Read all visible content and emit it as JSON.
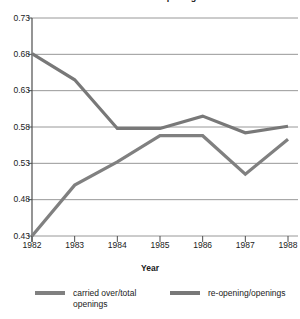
{
  "chart_data": {
    "type": "line",
    "title": "Trends in Job Openings",
    "xlabel": "Year",
    "ylabel": "",
    "x": [
      1982,
      1983,
      1984,
      1985,
      1986,
      1987,
      1988
    ],
    "categories": [
      "1982",
      "1983",
      "1984",
      "1985",
      "1986",
      "1987",
      "1988"
    ],
    "series": [
      {
        "name": "carried over/total openings",
        "color": "#808080",
        "values": [
          0.43,
          0.5,
          0.532,
          0.568,
          0.568,
          0.515,
          0.563
        ]
      },
      {
        "name": "re-opening/openings",
        "color": "#787878",
        "values": [
          0.681,
          0.645,
          0.578,
          0.578,
          0.595,
          0.572,
          0.581
        ]
      }
    ],
    "ylim": [
      0.43,
      0.73
    ],
    "xlim": [
      1982,
      1988
    ],
    "yticks": [
      "0.73",
      "0.68",
      "0.63",
      "0.58",
      "0.53",
      "0.48",
      "0.43"
    ],
    "ytick_values": [
      0.73,
      0.68,
      0.63,
      0.58,
      0.53,
      0.48,
      0.43
    ],
    "grid": true,
    "legend_position": "bottom"
  },
  "axes": {
    "x_label": "Year"
  },
  "legend": {
    "entries": [
      {
        "label": "carried over/total openings"
      },
      {
        "label": "re-opening/openings"
      }
    ]
  },
  "colors": {
    "line_a": "#808080",
    "line_b": "#787878",
    "grid": "#8c8c8c",
    "axis": "#4d4d4d",
    "text": "#1a1a1a"
  }
}
